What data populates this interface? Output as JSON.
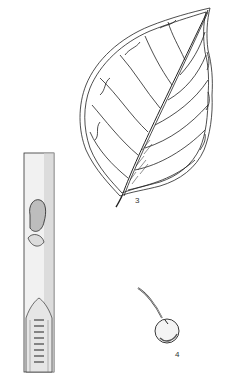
{
  "figure": {
    "type": "botanical line illustration",
    "labels": {
      "leaf": "3",
      "fruit": "4"
    },
    "parts": [
      "twig-with-bud-and-section",
      "leaf",
      "fruit-with-stalk"
    ],
    "colors": {
      "ink": "#222222",
      "background": "#ffffff"
    }
  }
}
